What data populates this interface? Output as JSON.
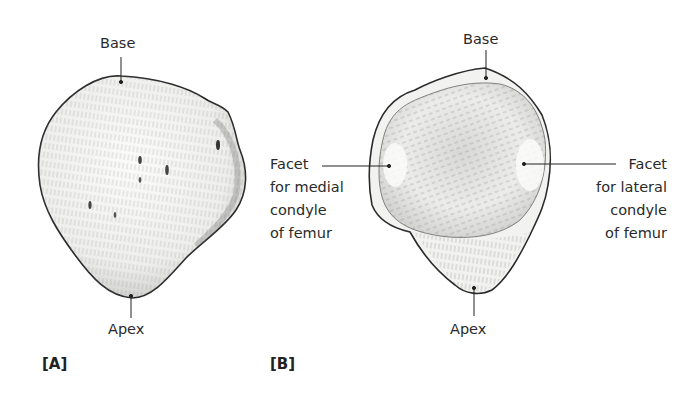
{
  "figure": {
    "panels": [
      {
        "id": "A",
        "tag": "[A]",
        "view": "anterior surface of patella",
        "labels": {
          "base": "Base",
          "apex": "Apex"
        }
      },
      {
        "id": "B",
        "tag": "[B]",
        "view": "posterior (articular) surface of patella",
        "labels": {
          "base": "Base",
          "apex": "Apex",
          "medial_facet": [
            "Facet",
            "for medial",
            "condyle",
            "of femur"
          ],
          "lateral_facet": [
            "Facet",
            "for lateral",
            "condyle",
            "of femur"
          ]
        }
      }
    ],
    "colors": {
      "outline": "#2b2b2b",
      "shading": "#9a9a9a",
      "fill": "#f4f4f2",
      "text": "#2a2a2a"
    }
  }
}
